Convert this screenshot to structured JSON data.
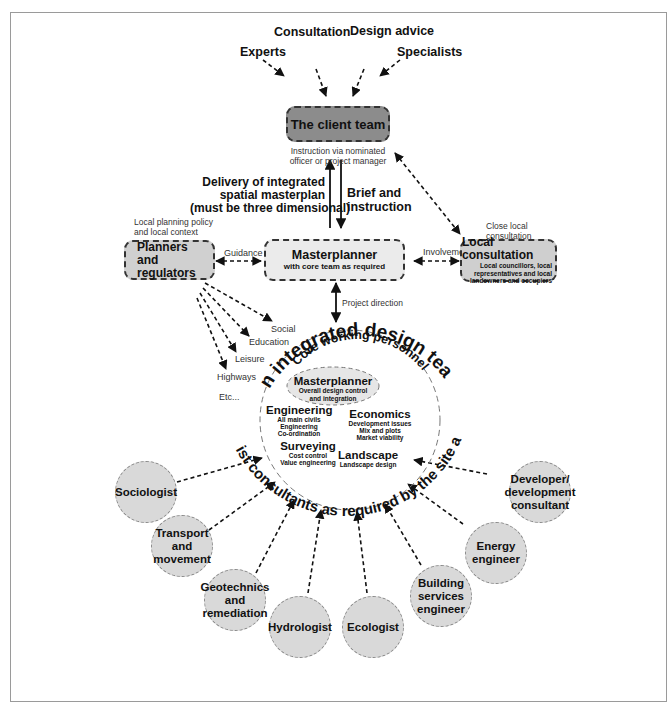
{
  "inputs": {
    "experts": "Experts",
    "consultation": "Consultation",
    "design_advice": "Design advice",
    "specialists": "Specialists"
  },
  "client_team": {
    "title": "The client team",
    "note_line1": "Instruction via nominated",
    "note_line2": "officer or project manager",
    "fill": "#8c8c8c"
  },
  "flows": {
    "delivery_line1": "Delivery of  integrated",
    "delivery_line2": "spatial masterplan",
    "delivery_line3": "(must be three dimensional)",
    "brief_line1": "Brief and",
    "brief_line2": "instruction",
    "guidance": "Guidance",
    "involvement": "Involvement",
    "project_direction": "Project direction"
  },
  "planners": {
    "context_line1": "Local planning policy",
    "context_line2": "and local context",
    "title_line1": "Planners",
    "title_line2": "and regulators",
    "fill": "#d0d0d0",
    "fan_labels": [
      "Social",
      "Education",
      "Leisure",
      "Highways",
      "Etc..."
    ]
  },
  "masterplanner_box": {
    "title": "Masterplanner",
    "subtitle": "with core team as required",
    "fill": "#ebebeb"
  },
  "local_consultation": {
    "context_line1": "Close local",
    "context_line2": "consultation",
    "title": "Local consultation",
    "desc_line1": "Local councillors, local",
    "desc_line2": "representatives and local",
    "desc_line3": "landowners and occupiers",
    "fill": "#cfcfcf"
  },
  "design_team": {
    "arc_title": "An integrated design team",
    "core_arc": "Core working personnel",
    "masterplanner": {
      "title": "Masterplanner",
      "line1": "Overall design control",
      "line2": "and integration"
    },
    "engineering": {
      "title": "Engineering",
      "line1": "All main civils",
      "line2": "Engineering",
      "line3": "Co-ordination"
    },
    "economics": {
      "title": "Economics",
      "line1": "Development issues",
      "line2": "Mix and plots",
      "line3": "Market viability"
    },
    "surveying": {
      "title": "Surveying",
      "line1": "Cost control",
      "line2": "Value engineering"
    },
    "landscape": {
      "title": "Landscape",
      "line1": "Landscape design"
    }
  },
  "specialists": {
    "arc_title": "Specialist consultants as required by the site and brief",
    "fill": "#d9d9d9",
    "items": [
      {
        "line1": "Sociologist",
        "line2": "",
        "line3": ""
      },
      {
        "line1": "Transport",
        "line2": "and",
        "line3": "movement"
      },
      {
        "line1": "Geotechnics",
        "line2": "and",
        "line3": "remediation"
      },
      {
        "line1": "Hydrologist",
        "line2": "",
        "line3": ""
      },
      {
        "line1": "Ecologist",
        "line2": "",
        "line3": ""
      },
      {
        "line1": "Building",
        "line2": "services",
        "line3": "engineer"
      },
      {
        "line1": "Energy",
        "line2": "engineer",
        "line3": ""
      },
      {
        "line1": "Developer/",
        "line2": "development",
        "line3": "consultant"
      }
    ]
  }
}
